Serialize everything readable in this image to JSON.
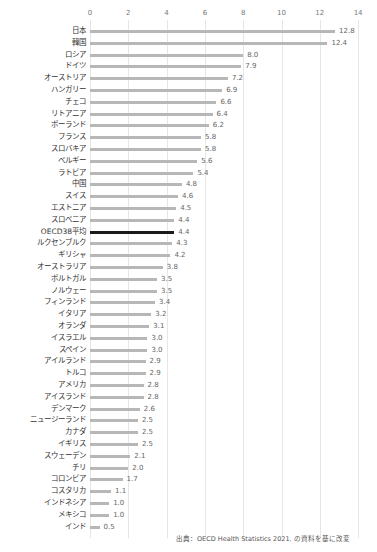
{
  "chart_data": {
    "type": "bar",
    "orientation": "horizontal",
    "title": "",
    "xlabel": "",
    "ylabel": "",
    "xlim": [
      0,
      14
    ],
    "x_ticks": [
      0,
      2,
      4,
      6,
      8,
      10,
      12,
      14
    ],
    "grid": true,
    "highlight_color": "#1a1a1a",
    "bar_color": "#b7b7b7",
    "categories": [
      "日本",
      "韓国",
      "ロシア",
      "ドイツ",
      "オーストリア",
      "ハンガリー",
      "チェコ",
      "リトアニア",
      "ポーランド",
      "フランス",
      "スロバキア",
      "ベルギー",
      "ラトビア",
      "中国",
      "スイス",
      "エストニア",
      "スロベニア",
      "OECD38平均",
      "ルクセンブルク",
      "ギリシャ",
      "オーストラリア",
      "ポルトガル",
      "ノルウェー",
      "フィンランド",
      "イタリア",
      "オランダ",
      "イスラエル",
      "スペイン",
      "アイルランド",
      "トルコ",
      "アメリカ",
      "アイスランド",
      "デンマーク",
      "ニュージーランド",
      "カナダ",
      "イギリス",
      "スウェーデン",
      "チリ",
      "コロンビア",
      "コスタリカ",
      "インドネシア",
      "メキシコ",
      "インド"
    ],
    "values": [
      12.8,
      12.4,
      8.0,
      7.9,
      7.2,
      6.9,
      6.6,
      6.4,
      6.2,
      5.8,
      5.8,
      5.6,
      5.4,
      4.8,
      4.6,
      4.5,
      4.4,
      4.4,
      4.3,
      4.2,
      3.8,
      3.5,
      3.5,
      3.4,
      3.2,
      3.1,
      3.0,
      3.0,
      2.9,
      2.9,
      2.8,
      2.8,
      2.6,
      2.5,
      2.5,
      2.5,
      2.1,
      2.0,
      1.7,
      1.1,
      1.0,
      1.0,
      0.5
    ],
    "value_labels": [
      "12.8",
      "12.4",
      "8.0",
      "7.9",
      "7.2",
      "6.9",
      "6.6",
      "6.4",
      "6.2",
      "5.8",
      "5.8",
      "5.6",
      "5.4",
      "4.8",
      "4.6",
      "4.5",
      "4.4",
      "4.4",
      "4.3",
      "4.2",
      "3.8",
      "3.5",
      "3.5",
      "3.4",
      "3.2",
      "3.1",
      "3.0",
      "3.0",
      "2.9",
      "2.9",
      "2.8",
      "2.8",
      "2.6",
      "2.5",
      "2.5",
      "2.5",
      "2.1",
      "2.0",
      "1.7",
      "1.1",
      "1.0",
      "1.0",
      "0.5"
    ],
    "highlighted_category": "OECD38平均",
    "annotations": [
      "出典：OECD Health Statistics 2021. の資料を基に改変"
    ]
  },
  "source_note": "出典：OECD Health Statistics 2021. の資料を基に改変"
}
